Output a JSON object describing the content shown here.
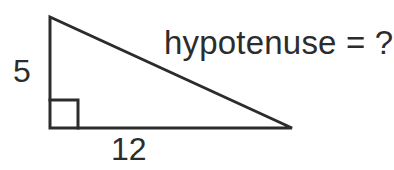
{
  "figure": {
    "kind": "right-triangle-diagram",
    "background_color": "#ffffff",
    "stroke_color": "#2c2c2c",
    "labels": {
      "vertical_leg": "5",
      "horizontal_leg": "12",
      "hypotenuse": "hypotenuse = ?"
    },
    "geometry": {
      "apex": {
        "x": 50,
        "y": 17
      },
      "right_angle_vertex": {
        "x": 50,
        "y": 128
      },
      "base_right_vertex": {
        "x": 292,
        "y": 128
      },
      "right_angle_marker_size": 28,
      "stroke_width": 3
    },
    "icons": {
      "right_angle_marker": "right-angle-marker-icon"
    }
  }
}
